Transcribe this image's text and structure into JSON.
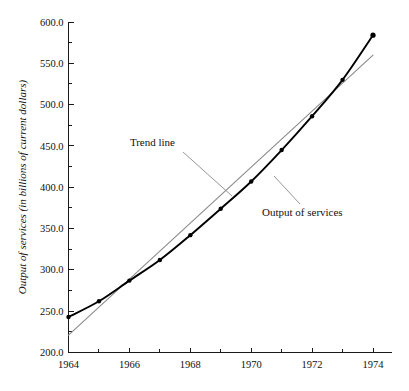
{
  "chart_data": {
    "type": "line",
    "title": "",
    "xlabel": "",
    "ylabel": "Output of services (in billions of current dollars)",
    "xlim": [
      1964,
      1974
    ],
    "ylim": [
      200.0,
      600.0
    ],
    "grid": false,
    "legend_position": "none",
    "x": [
      1964,
      1965,
      1966,
      1967,
      1968,
      1969,
      1970,
      1971,
      1972,
      1973,
      1974
    ],
    "xtick_labels": [
      "1964",
      "1966",
      "1968",
      "1970",
      "1972",
      "1974"
    ],
    "xtick_values": [
      1964,
      1966,
      1968,
      1970,
      1972,
      1974
    ],
    "xtick_minor_values": [
      1965,
      1967,
      1969,
      1971,
      1973
    ],
    "ytick_labels": [
      "200.0",
      "250.0",
      "300.0",
      "350.0",
      "400.0",
      "450.0",
      "500.0",
      "550.0",
      "600.0"
    ],
    "ytick_values": [
      200.0,
      250.0,
      300.0,
      350.0,
      400.0,
      450.0,
      500.0,
      550.0,
      600.0
    ],
    "ytick_minor_values": [
      225.0,
      275.0,
      325.0,
      375.0,
      425.0,
      475.0,
      525.0,
      575.0
    ],
    "series": [
      {
        "name": "Output of services",
        "color": "#000000",
        "markers": true,
        "values": [
          243,
          262,
          287,
          312,
          342,
          374,
          407,
          445,
          486,
          530,
          584
        ]
      },
      {
        "name": "Trend line",
        "color": "#8a8a8a",
        "markers": false,
        "values": [
          221,
          255,
          289,
          323,
          357,
          391,
          425,
          458,
          492,
          526,
          560
        ]
      }
    ],
    "annotations": [
      {
        "text": "Trend line",
        "x": 1968.0,
        "y": 462.0
      },
      {
        "text": "Output of services",
        "x": 1970.8,
        "y": 378.0
      }
    ]
  }
}
